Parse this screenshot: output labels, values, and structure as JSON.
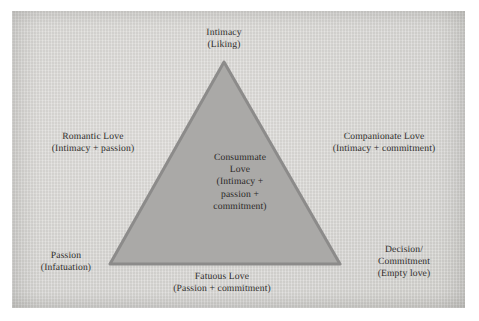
{
  "figure": {
    "name": "sternberg-triangular-theory-of-love",
    "width": 479,
    "height": 321
  },
  "colors": {
    "page_background": "#ffffff",
    "panel_background": "#d9d8d5",
    "triangle_fill": "#a9a8a6",
    "triangle_stroke": "#8a8988",
    "text": "#1d1b1a"
  },
  "triangle": {
    "apex": {
      "x": 224,
      "y": 62
    },
    "bottom_left": {
      "x": 110,
      "y": 264
    },
    "bottom_right": {
      "x": 340,
      "y": 264
    },
    "stroke_width": 3
  },
  "labels": {
    "intimacy": {
      "name": "intimacy-vertex-label",
      "lines": [
        "Intimacy",
        "(Liking)"
      ]
    },
    "romantic": {
      "name": "romantic-love-side-label",
      "lines": [
        "Romantic Love",
        "(Intimacy + passion)"
      ]
    },
    "companionate": {
      "name": "companionate-love-side-label",
      "lines": [
        "Companionate Love",
        "(Intimacy + commitment)"
      ]
    },
    "consummate": {
      "name": "consummate-love-center-label",
      "lines": [
        "Consummate",
        "Love",
        "(Intimacy +",
        "passion +",
        "commitment)"
      ]
    },
    "passion": {
      "name": "passion-vertex-label",
      "lines": [
        "Passion",
        "(Infatuation)"
      ]
    },
    "decision": {
      "name": "decision-commitment-vertex-label",
      "lines": [
        "Decision/",
        "Commitment",
        "(Empty love)"
      ]
    },
    "fatuous": {
      "name": "fatuous-love-side-label",
      "lines": [
        "Fatuous Love",
        "(Passion + commitment)"
      ]
    }
  }
}
